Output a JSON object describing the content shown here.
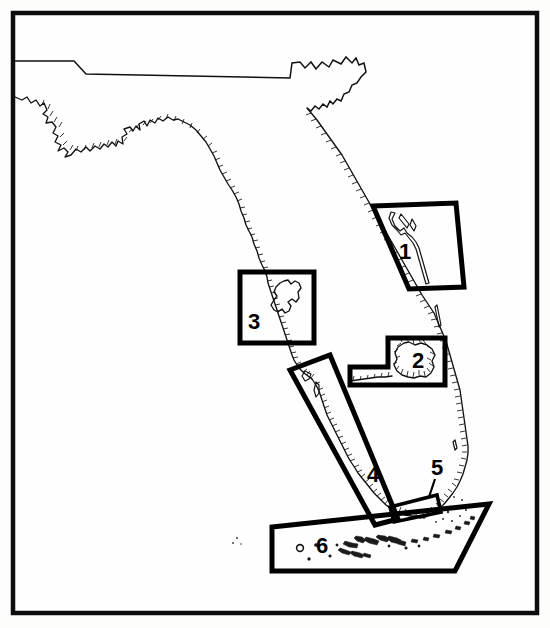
{
  "figure": {
    "width": 550,
    "height": 628,
    "background_color": "#fdfdfc",
    "line_color": "#111111",
    "frame": {
      "name": "outer-border",
      "color": "#0d0d0d",
      "thickness": 4.5
    }
  },
  "map": {
    "region_name": "Florida",
    "features": [
      {
        "name": "state-boundary-line",
        "style": "plain-line"
      },
      {
        "name": "gulf-coastline",
        "style": "hachured-line"
      },
      {
        "name": "atlantic-coastline",
        "style": "hachured-line"
      },
      {
        "name": "lake-okeechobee",
        "style": "closed-outline"
      },
      {
        "name": "tampa-bay",
        "style": "closed-outline"
      },
      {
        "name": "indian-river-lagoon",
        "style": "closed-outline"
      },
      {
        "name": "florida-keys",
        "style": "island-dots"
      }
    ]
  },
  "study_areas": [
    {
      "id": "1",
      "label": "1",
      "shape": "parallelogram",
      "label_x": 405,
      "label_y": 253,
      "outline_points": "373,206 456,203 464,287 409,289",
      "thickness": 5
    },
    {
      "id": "2",
      "label": "2",
      "shape": "notched-rectangle",
      "label_x": 418,
      "label_y": 362,
      "outline_points": "388,338 445,338 445,385 350,385 350,367 388,367",
      "thickness": 5
    },
    {
      "id": "3",
      "label": "3",
      "shape": "rectangle",
      "label_x": 254,
      "label_y": 323,
      "outline_points": "240,272 314,272 314,343 240,343",
      "thickness": 5
    },
    {
      "id": "4",
      "label": "4",
      "shape": "parallelogram",
      "label_x": 373,
      "label_y": 476,
      "outline_points": "290,370 330,355 398,519 375,525",
      "thickness": 5
    },
    {
      "id": "5",
      "label": "5",
      "shape": "thin-sliver",
      "label_x": 437,
      "label_y": 469,
      "outline_points": "390,507 437,495 441,512 394,522",
      "leader_line": "435,479 429,497",
      "thickness": 3.6
    },
    {
      "id": "6",
      "label": "6",
      "shape": "polygon",
      "label_x": 322,
      "label_y": 547,
      "outline_points": "272,527 489,504 455,571 272,571",
      "thickness": 5
    }
  ]
}
